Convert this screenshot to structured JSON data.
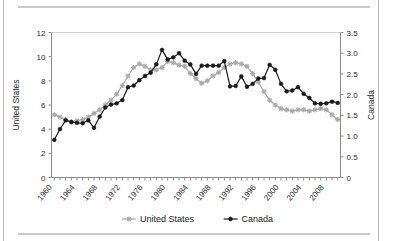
{
  "figure": {
    "background_color": "#ffffff",
    "rule_color": "#c9c9c9",
    "border_color": "#b9b9b9"
  },
  "chart_data": {
    "type": "line",
    "title": "",
    "subtitle": "",
    "xlabel": "",
    "grid": false,
    "legend_position": "bottom-center",
    "x": [
      1960,
      1961,
      1962,
      1963,
      1964,
      1965,
      1966,
      1967,
      1968,
      1969,
      1970,
      1971,
      1972,
      1973,
      1974,
      1975,
      1976,
      1977,
      1978,
      1979,
      1980,
      1981,
      1982,
      1983,
      1984,
      1985,
      1986,
      1987,
      1988,
      1989,
      1990,
      1991,
      1992,
      1993,
      1994,
      1995,
      1996,
      1997,
      1998,
      1999,
      2000,
      2001,
      2002,
      2003,
      2004,
      2005,
      2006,
      2007,
      2008,
      2009,
      2010
    ],
    "x_tick_labels": [
      "1960",
      "1964",
      "1968",
      "1972",
      "1976",
      "1980",
      "1984",
      "1988",
      "1992",
      "1996",
      "2000",
      "2004",
      "2008"
    ],
    "x_tick_values": [
      1960,
      1964,
      1968,
      1972,
      1976,
      1980,
      1984,
      1988,
      1992,
      1996,
      2000,
      2004,
      2008
    ],
    "xlim": [
      1959.5,
      2010.5
    ],
    "axes": [
      {
        "id": "left",
        "label": "United States",
        "ticks": [
          0,
          2,
          4,
          6,
          8,
          10,
          12
        ],
        "tick_labels": [
          "0",
          "2",
          "4",
          "6",
          "8",
          "10",
          "12"
        ],
        "lim": [
          0,
          12
        ]
      },
      {
        "id": "right",
        "label": "Canada",
        "ticks": [
          0,
          0.5,
          1.0,
          1.5,
          2.0,
          2.5,
          3.0,
          3.5
        ],
        "tick_labels": [
          "0",
          "0.5",
          "1.0",
          "1.5",
          "2.0",
          "2.5",
          "3.0",
          "3.5"
        ],
        "lim": [
          0,
          3.5
        ]
      }
    ],
    "series": [
      {
        "name": "United States",
        "axis": "left",
        "color": "#a8a8a8",
        "marker": "star",
        "values": [
          5.2,
          5.0,
          4.8,
          4.6,
          4.7,
          4.8,
          5.0,
          5.3,
          5.6,
          6.0,
          6.4,
          6.9,
          7.6,
          8.4,
          9.1,
          9.4,
          9.2,
          8.9,
          8.9,
          9.1,
          9.6,
          9.5,
          9.3,
          9.2,
          8.6,
          8.2,
          7.8,
          8.0,
          8.4,
          8.7,
          9.1,
          9.4,
          9.5,
          9.4,
          9.2,
          8.6,
          7.9,
          7.1,
          6.4,
          6.0,
          5.7,
          5.6,
          5.5,
          5.6,
          5.6,
          5.5,
          5.6,
          5.7,
          5.6,
          5.2,
          4.8
        ]
      },
      {
        "name": "Canada",
        "axis": "right",
        "color": "#1a1a1a",
        "marker": "circle",
        "values": [
          0.91,
          1.17,
          1.38,
          1.34,
          1.32,
          1.31,
          1.38,
          1.2,
          1.47,
          1.69,
          1.76,
          1.79,
          1.87,
          2.18,
          2.22,
          2.35,
          2.45,
          2.53,
          2.73,
          3.08,
          2.85,
          2.9,
          3.0,
          2.82,
          2.73,
          2.5,
          2.7,
          2.7,
          2.7,
          2.7,
          2.81,
          2.2,
          2.21,
          2.44,
          2.19,
          2.26,
          2.39,
          2.4,
          2.72,
          2.6,
          2.26,
          2.08,
          2.1,
          2.18,
          2.02,
          1.92,
          1.79,
          1.78,
          1.79,
          1.83,
          1.8
        ]
      }
    ],
    "note_canada_values_are_right_axis_scale": true,
    "legend": [
      {
        "label": "United States",
        "color": "#a8a8a8",
        "marker": "star"
      },
      {
        "label": "Canada",
        "color": "#1a1a1a",
        "marker": "circle"
      }
    ]
  }
}
